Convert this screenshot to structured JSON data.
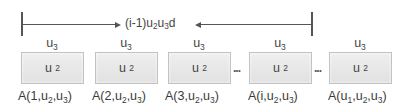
{
  "diagram": {
    "span_label": {
      "prefix": "(i-1)u",
      "sub1": "2",
      "mid": "u",
      "sub2": "3",
      "suffix": "d"
    },
    "columns": [
      {
        "top": {
          "base": "u",
          "sub": "3"
        },
        "box": {
          "base": "u",
          "sub": "2"
        },
        "label": {
          "pre": "A(1,u",
          "s1": "2",
          "mid": ",u",
          "s2": "3",
          "post": ")"
        }
      },
      {
        "top": {
          "base": "u",
          "sub": "3"
        },
        "box": {
          "base": "u",
          "sub": "2"
        },
        "label": {
          "pre": "A(2,u",
          "s1": "2",
          "mid": ",u",
          "s2": "3",
          "post": ")"
        }
      },
      {
        "top": {
          "base": "u",
          "sub": "3"
        },
        "box": {
          "base": "u",
          "sub": "2"
        },
        "label": {
          "pre": "A(3,u",
          "s1": "2",
          "mid": ",u",
          "s2": "3",
          "post": ")"
        }
      },
      {
        "top": {
          "base": "u",
          "sub": "3"
        },
        "box": {
          "base": "u",
          "sub": "2"
        },
        "label": {
          "pre": "A(i,u",
          "s1": "2",
          "mid": ",u",
          "s2": "3",
          "post": ")"
        }
      },
      {
        "top": {
          "base": "u",
          "sub": "3"
        },
        "box": {
          "base": "u",
          "sub": "2"
        },
        "label": {
          "pre": "A(u",
          "s0": "1",
          "pre2": ",u",
          "s1": "2",
          "mid": ",u",
          "s2": "3",
          "post": ")"
        }
      }
    ],
    "ellipses": [
      "...",
      "..."
    ],
    "colors": {
      "line": "#555555",
      "box_fill": "#e8e8e8",
      "box_border": "#c2c2c2",
      "text": "#444444"
    }
  }
}
